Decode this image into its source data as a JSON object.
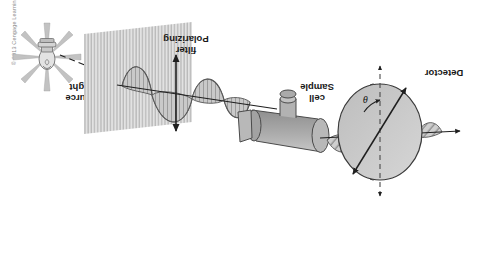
{
  "figure": {
    "credit": "© 2013 Cengage Learning",
    "orientation_note": "figure rendered rotated 180 degrees",
    "background_color": "#ffffff"
  },
  "labels": {
    "detector": "Detector",
    "sample_cell_line1": "Sample",
    "sample_cell_line2": "cell",
    "polarizing_filter_line1": "Polarizing",
    "polarizing_filter_line2": "filter",
    "light_source_line1": "Light",
    "light_source_line2": "source",
    "angle_symbol": "θ"
  },
  "colors": {
    "body_fill": "#b5b5b5",
    "disc_fill": "#c9c9c9",
    "wave_fill": "#c0c0c0",
    "filter_plane": "#d2d2d2",
    "stroke": "#3a3a3a",
    "text": "#1a1a1a",
    "credit_text": "#8a8a8a",
    "bulb_fill": "#dcdcdc",
    "ray_fill": "#c4c4c4"
  },
  "components": [
    {
      "name": "light-source",
      "label": "Light source",
      "order": 1
    },
    {
      "name": "unpolarized-beam",
      "label": "",
      "order": 2
    },
    {
      "name": "polarizing-filter",
      "label": "Polarizing filter",
      "order": 3
    },
    {
      "name": "plane-polarized-wave",
      "label": "",
      "order": 4
    },
    {
      "name": "sample-cell",
      "label": "Sample cell",
      "order": 5
    },
    {
      "name": "rotated-wave",
      "label": "",
      "order": 6
    },
    {
      "name": "detector",
      "label": "Detector",
      "order": 7
    },
    {
      "name": "rotation-angle",
      "label": "θ",
      "order": 8
    }
  ]
}
